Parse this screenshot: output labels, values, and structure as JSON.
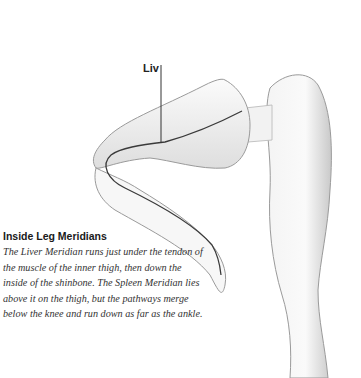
{
  "illustration": {
    "subject": "legs-inner-meridians",
    "meridian_label": "Liv",
    "meridian_line_color": "#3a3a3a"
  },
  "caption": {
    "title": "Inside Leg Meridians",
    "body": "The Liver Meridian runs just under the tendon of the muscle of the inner thigh, then down the inside of the shinbone. The Spleen Meridian lies above it on the thigh, but the pathways merge below the knee and run down as far as the ankle."
  }
}
